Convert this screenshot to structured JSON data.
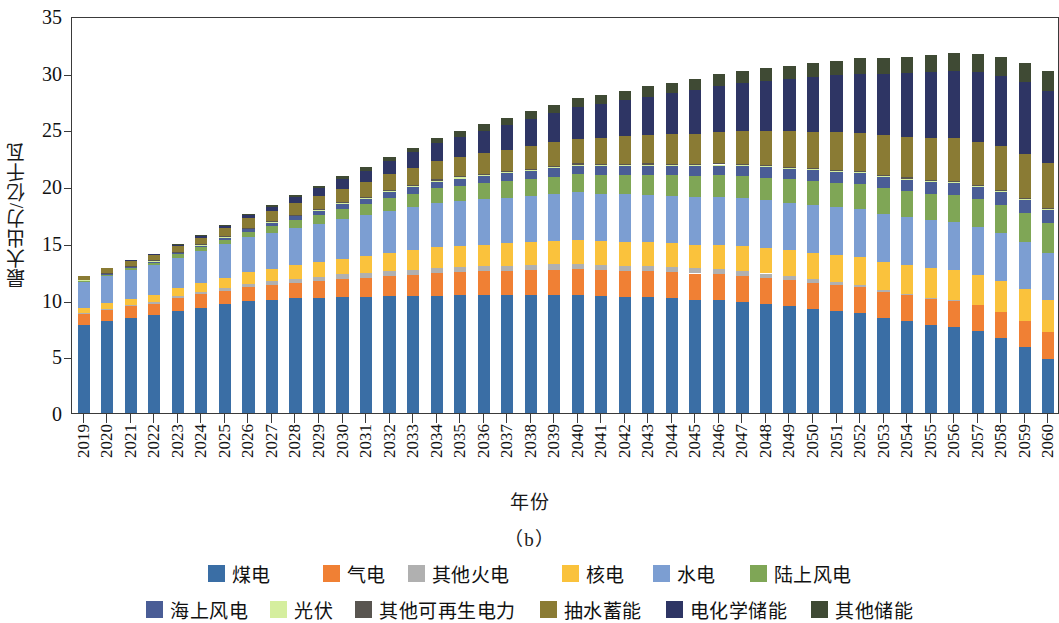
{
  "chart_data": {
    "type": "bar",
    "stacked": true,
    "title": "",
    "panel_label": "（b）",
    "xlabel": "年份",
    "ylabel": "最大出力/亿千瓦",
    "ylim": [
      0,
      35
    ],
    "yticks": [
      0,
      5,
      10,
      15,
      20,
      25,
      30,
      35
    ],
    "grid": false,
    "legend_position": "bottom",
    "categories": [
      "2019",
      "2020",
      "2021",
      "2022",
      "2023",
      "2024",
      "2025",
      "2026",
      "2027",
      "2028",
      "2029",
      "2030",
      "2031",
      "2032",
      "2033",
      "2034",
      "2035",
      "2036",
      "2037",
      "2038",
      "2039",
      "2040",
      "2041",
      "2042",
      "2043",
      "2044",
      "2045",
      "2046",
      "2047",
      "2048",
      "2049",
      "2050",
      "2051",
      "2052",
      "2053",
      "2054",
      "2055",
      "2056",
      "2057",
      "2058",
      "2059",
      "2060"
    ],
    "series": [
      {
        "name": "煤电",
        "color": "#3a6ea5",
        "values": [
          7.8,
          8.1,
          8.4,
          8.6,
          9.0,
          9.3,
          9.6,
          9.9,
          10.0,
          10.1,
          10.1,
          10.2,
          10.2,
          10.3,
          10.3,
          10.35,
          10.4,
          10.4,
          10.4,
          10.4,
          10.4,
          10.4,
          10.3,
          10.25,
          10.2,
          10.1,
          10.0,
          9.95,
          9.8,
          9.6,
          9.4,
          9.2,
          9.0,
          8.8,
          8.4,
          8.1,
          7.8,
          7.6,
          7.2,
          6.6,
          5.8,
          4.8
        ]
      },
      {
        "name": "气电",
        "color": "#f08034",
        "values": [
          0.9,
          0.95,
          1.0,
          1.05,
          1.1,
          1.15,
          1.2,
          1.25,
          1.3,
          1.4,
          1.5,
          1.6,
          1.7,
          1.8,
          1.9,
          2.0,
          2.05,
          2.1,
          2.15,
          2.2,
          2.25,
          2.3,
          2.3,
          2.3,
          2.3,
          2.3,
          2.3,
          2.3,
          2.3,
          2.3,
          2.3,
          2.3,
          2.3,
          2.3,
          2.3,
          2.3,
          2.3,
          2.3,
          2.3,
          2.3,
          2.3,
          2.3
        ]
      },
      {
        "name": "其他火电",
        "color": "#b0b0b0",
        "values": [
          0.1,
          0.12,
          0.14,
          0.16,
          0.18,
          0.2,
          0.22,
          0.25,
          0.3,
          0.35,
          0.4,
          0.42,
          0.45,
          0.45,
          0.45,
          0.45,
          0.45,
          0.45,
          0.45,
          0.45,
          0.45,
          0.45,
          0.45,
          0.45,
          0.45,
          0.45,
          0.45,
          0.45,
          0.45,
          0.4,
          0.35,
          0.3,
          0.25,
          0.2,
          0.15,
          0.1,
          0.08,
          0.05,
          0.0,
          0.0,
          0.0,
          0.0
        ]
      },
      {
        "name": "核电",
        "color": "#fac23c",
        "values": [
          0.45,
          0.5,
          0.55,
          0.6,
          0.7,
          0.8,
          0.9,
          1.0,
          1.1,
          1.2,
          1.3,
          1.4,
          1.5,
          1.6,
          1.7,
          1.8,
          1.85,
          1.9,
          1.95,
          2.0,
          2.05,
          2.1,
          2.1,
          2.1,
          2.1,
          2.1,
          2.1,
          2.15,
          2.2,
          2.25,
          2.3,
          2.35,
          2.4,
          2.45,
          2.5,
          2.55,
          2.6,
          2.65,
          2.7,
          2.75,
          2.8,
          2.85
        ]
      },
      {
        "name": "水电",
        "color": "#7c9ed2",
        "values": [
          2.3,
          2.4,
          2.5,
          2.6,
          2.7,
          2.8,
          2.95,
          3.1,
          3.2,
          3.3,
          3.4,
          3.5,
          3.6,
          3.7,
          3.8,
          3.9,
          3.95,
          4.0,
          4.05,
          4.1,
          4.15,
          4.2,
          4.2,
          4.2,
          4.2,
          4.2,
          4.2,
          4.2,
          4.2,
          4.2,
          4.2,
          4.2,
          4.2,
          4.2,
          4.2,
          4.2,
          4.2,
          4.2,
          4.2,
          4.2,
          4.2,
          4.2
        ]
      },
      {
        "name": "陆上风电",
        "color": "#7fa656",
        "values": [
          0.1,
          0.15,
          0.2,
          0.25,
          0.3,
          0.35,
          0.4,
          0.5,
          0.6,
          0.7,
          0.8,
          0.9,
          1.0,
          1.1,
          1.2,
          1.3,
          1.35,
          1.4,
          1.45,
          1.5,
          1.55,
          1.6,
          1.65,
          1.7,
          1.75,
          1.8,
          1.85,
          1.9,
          1.95,
          2.0,
          2.05,
          2.1,
          2.15,
          2.2,
          2.25,
          2.3,
          2.35,
          2.4,
          2.45,
          2.5,
          2.55,
          2.6
        ]
      },
      {
        "name": "海上风电",
        "color": "#4a5d96",
        "values": [
          0.05,
          0.06,
          0.08,
          0.1,
          0.12,
          0.15,
          0.18,
          0.22,
          0.26,
          0.3,
          0.35,
          0.4,
          0.45,
          0.5,
          0.55,
          0.6,
          0.62,
          0.65,
          0.68,
          0.7,
          0.72,
          0.75,
          0.76,
          0.78,
          0.8,
          0.82,
          0.84,
          0.86,
          0.88,
          0.9,
          0.92,
          0.94,
          0.96,
          0.98,
          1.0,
          1.02,
          1.04,
          1.06,
          1.08,
          1.1,
          1.12,
          1.15
        ]
      },
      {
        "name": "光伏",
        "color": "#d5ee9e",
        "values": [
          0.02,
          0.02,
          0.03,
          0.03,
          0.04,
          0.04,
          0.05,
          0.05,
          0.06,
          0.06,
          0.07,
          0.07,
          0.08,
          0.08,
          0.09,
          0.09,
          0.1,
          0.1,
          0.1,
          0.1,
          0.1,
          0.1,
          0.1,
          0.1,
          0.1,
          0.1,
          0.1,
          0.1,
          0.1,
          0.1,
          0.1,
          0.1,
          0.1,
          0.1,
          0.1,
          0.1,
          0.1,
          0.1,
          0.1,
          0.1,
          0.1,
          0.1
        ]
      },
      {
        "name": "其他可再生电力",
        "color": "#595550",
        "values": [
          0.04,
          0.05,
          0.05,
          0.06,
          0.06,
          0.07,
          0.07,
          0.08,
          0.08,
          0.09,
          0.09,
          0.1,
          0.1,
          0.1,
          0.1,
          0.1,
          0.1,
          0.1,
          0.1,
          0.1,
          0.1,
          0.1,
          0.1,
          0.1,
          0.1,
          0.1,
          0.1,
          0.1,
          0.1,
          0.1,
          0.1,
          0.1,
          0.1,
          0.1,
          0.1,
          0.1,
          0.1,
          0.1,
          0.1,
          0.1,
          0.1,
          0.1
        ]
      },
      {
        "name": "抽水蓄能",
        "color": "#8a7b34",
        "values": [
          0.35,
          0.4,
          0.45,
          0.5,
          0.55,
          0.6,
          0.7,
          0.8,
          0.9,
          1.0,
          1.1,
          1.2,
          1.3,
          1.4,
          1.5,
          1.6,
          1.7,
          1.8,
          1.9,
          2.0,
          2.1,
          2.2,
          2.3,
          2.4,
          2.5,
          2.6,
          2.7,
          2.8,
          2.9,
          3.0,
          3.1,
          3.2,
          3.3,
          3.4,
          3.5,
          3.6,
          3.7,
          3.75,
          3.8,
          3.85,
          3.9,
          3.9
        ]
      },
      {
        "name": "电化学储能",
        "color": "#2e3564",
        "values": [
          0.0,
          0.0,
          0.02,
          0.05,
          0.1,
          0.15,
          0.22,
          0.3,
          0.4,
          0.55,
          0.7,
          0.85,
          1.0,
          1.2,
          1.4,
          1.6,
          1.8,
          2.0,
          2.2,
          2.4,
          2.6,
          2.8,
          3.0,
          3.2,
          3.4,
          3.6,
          3.8,
          4.0,
          4.2,
          4.4,
          4.6,
          4.8,
          5.0,
          5.2,
          5.4,
          5.6,
          5.8,
          5.95,
          6.1,
          6.2,
          6.3,
          6.4
        ]
      },
      {
        "name": "其他储能",
        "color": "#3f4a34",
        "values": [
          0.0,
          0.0,
          0.0,
          0.0,
          0.02,
          0.04,
          0.06,
          0.08,
          0.1,
          0.15,
          0.2,
          0.25,
          0.3,
          0.35,
          0.4,
          0.45,
          0.5,
          0.55,
          0.6,
          0.65,
          0.7,
          0.75,
          0.8,
          0.85,
          0.9,
          0.95,
          1.0,
          1.05,
          1.1,
          1.15,
          1.2,
          1.25,
          1.3,
          1.35,
          1.4,
          1.45,
          1.5,
          1.55,
          1.6,
          1.65,
          1.7,
          1.75
        ]
      }
    ],
    "totals": [
      12.1,
      12.75,
      13.32,
      13.96,
      14.87,
      15.65,
      16.55,
      17.53,
      18.3,
      19.2,
      20.01,
      20.91,
      21.73,
      22.58,
      23.39,
      24.14,
      24.77,
      25.45,
      26.03,
      26.6,
      27.17,
      27.75,
      28.06,
      28.38,
      28.7,
      29.02,
      29.34,
      29.76,
      30.08,
      30.35,
      30.62,
      30.89,
      31.06,
      31.23,
      31.25,
      31.22,
      31.25,
      31.32,
      31.31,
      31.15,
      30.65,
      30.15
    ]
  },
  "legend": {
    "rows": [
      [
        {
          "label": "煤电",
          "color": "#3a6ea5"
        },
        {
          "label": "气电",
          "color": "#f08034"
        },
        {
          "label": "其他火电",
          "color": "#b0b0b0"
        },
        {
          "label": "核电",
          "color": "#fac23c"
        },
        {
          "label": "水电",
          "color": "#7c9ed2"
        },
        {
          "label": "陆上风电",
          "color": "#7fa656"
        }
      ],
      [
        {
          "label": "海上风电",
          "color": "#4a5d96"
        },
        {
          "label": "光伏",
          "color": "#d5ee9e"
        },
        {
          "label": "其他可再生电力",
          "color": "#595550"
        },
        {
          "label": "抽水蓄能",
          "color": "#8a7b34"
        },
        {
          "label": "电化学储能",
          "color": "#2e3564"
        },
        {
          "label": "其他储能",
          "color": "#3f4a34"
        }
      ]
    ]
  }
}
